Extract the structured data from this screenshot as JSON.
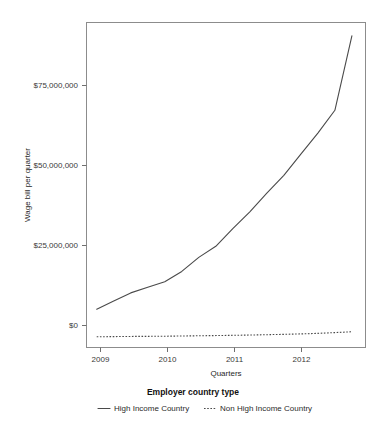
{
  "chart_data": {
    "type": "line",
    "title": "",
    "xlabel": "Quarters",
    "ylabel": "Wage bill per quarter",
    "xtick_labels": [
      "2009",
      "2010",
      "2011",
      "2012"
    ],
    "xtick_values": [
      2009,
      2010,
      2011,
      2012
    ],
    "ytick_labels": [
      "$0",
      "$25,000,000",
      "$50,000,000",
      "$75,000,000"
    ],
    "ytick_values": [
      0,
      25000000,
      50000000,
      75000000
    ],
    "xlim": [
      2008.85,
      2012.95
    ],
    "ylim": [
      -3000000,
      94000000
    ],
    "grid": false,
    "legend_position": "bottom",
    "legend_title": "Employer country type",
    "x": [
      2009.0,
      2009.25,
      2009.5,
      2009.75,
      2010.0,
      2010.25,
      2010.5,
      2010.75,
      2011.0,
      2011.25,
      2011.5,
      2011.75,
      2012.0,
      2012.25,
      2012.5,
      2012.75
    ],
    "series": [
      {
        "name": "High Income Country",
        "style": "solid",
        "color": "#4a4a4a",
        "values": [
          8400000,
          10900000,
          13300000,
          15000000,
          16600000,
          19700000,
          23900000,
          27200000,
          32500000,
          37500000,
          43100000,
          48400000,
          54700000,
          61000000,
          67800000,
          90000000
        ]
      },
      {
        "name": "Non High Income Country",
        "style": "dashed",
        "color": "#4a4a4a",
        "values": [
          200000,
          250000,
          300000,
          330000,
          370000,
          430000,
          500000,
          560000,
          640000,
          720000,
          820000,
          930000,
          1060000,
          1220000,
          1450000,
          1700000
        ]
      }
    ],
    "annotations": []
  },
  "axes": {
    "x_axis_title": "Quarters",
    "y_axis_title": "Wage bill per quarter"
  },
  "legend": {
    "title": "Employer country type",
    "entries": [
      {
        "label": "High Income Country",
        "marker": "solid-line-swatch"
      },
      {
        "label": "Non High Income Country",
        "marker": "dashed-line-swatch"
      }
    ]
  },
  "colors": {
    "line": "#4a4a4a",
    "panel_border": "#8c8c8c",
    "text": "#2b2b2b",
    "background": "#ffffff"
  }
}
